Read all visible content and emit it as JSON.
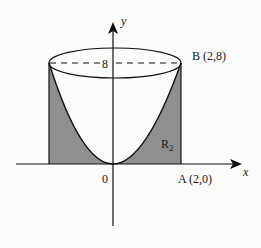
{
  "diagram": {
    "axis_labels": {
      "x": "x",
      "y": "y"
    },
    "origin_label": "0",
    "height_label": "8",
    "point_b": "B (2,8)",
    "point_a": "A (2,0)",
    "region_label": "R",
    "region_subscript": "2",
    "colors": {
      "shade": "#8f8f8f",
      "line": "#111111",
      "background": "#fbfbfa"
    }
  }
}
